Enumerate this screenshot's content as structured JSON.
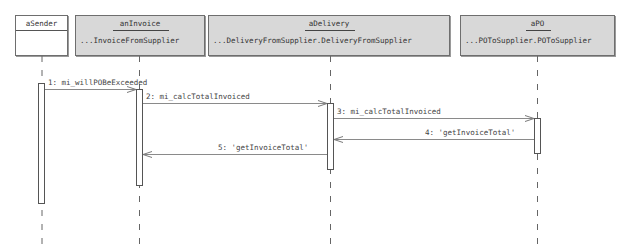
{
  "lifelines": [
    {
      "id": "aSender",
      "name": "aSender",
      "class": "",
      "style": "white"
    },
    {
      "id": "anInvoice",
      "name": "anInvoice",
      "class": "...InvoiceFromSupplier",
      "style": "gray"
    },
    {
      "id": "aDelivery",
      "name": "aDelivery",
      "class": "...DeliveryFromSupplier.DeliveryFromSupplier",
      "style": "gray"
    },
    {
      "id": "aPO",
      "name": "aPO",
      "class": "...POToSupplier.POToSupplier",
      "style": "gray"
    }
  ],
  "messages": [
    {
      "seq": 1,
      "label": "1: mi_willPOBeExceeded",
      "from": "aSender",
      "to": "anInvoice",
      "kind": "call"
    },
    {
      "seq": 2,
      "label": "2: mi_calcTotalInvoiced",
      "from": "anInvoice",
      "to": "aDelivery",
      "kind": "call"
    },
    {
      "seq": 3,
      "label": "3: mi_calcTotalInvoiced",
      "from": "aDelivery",
      "to": "aPO",
      "kind": "call"
    },
    {
      "seq": 4,
      "label": "4: 'getInvoiceTotal'",
      "from": "aPO",
      "to": "aDelivery",
      "kind": "return"
    },
    {
      "seq": 5,
      "label": "5: 'getInvoiceTotal'",
      "from": "aDelivery",
      "to": "anInvoice",
      "kind": "return"
    }
  ],
  "colors": {
    "box_fill": "#d8d8d8",
    "line": "#6e6e6e",
    "arrow": "#8a8a8a"
  }
}
